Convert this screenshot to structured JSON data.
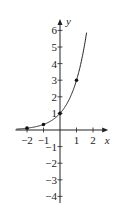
{
  "chart_data": {
    "type": "line",
    "title": "",
    "function": "y = 3^x",
    "xlabel": "x",
    "ylabel": "y",
    "xlim": [
      -2.7,
      2.8
    ],
    "ylim": [
      -4.4,
      6.5
    ],
    "x_ticks": [
      -2,
      -1,
      1,
      2
    ],
    "x_tick_labels": [
      "−2",
      "−1",
      "1",
      "2"
    ],
    "y_ticks": [
      -4,
      -3,
      -2,
      -1,
      1,
      2,
      3,
      4,
      5,
      6
    ],
    "y_tick_labels": [
      "−4",
      "−3",
      "−2",
      "−1",
      "1",
      "2",
      "3",
      "4",
      "5",
      "6"
    ],
    "points": [
      {
        "x": -2,
        "y": 0.111
      },
      {
        "x": -1,
        "y": 0.333
      },
      {
        "x": 0,
        "y": 1
      },
      {
        "x": 1,
        "y": 3
      }
    ],
    "grid": false,
    "legend": null
  }
}
